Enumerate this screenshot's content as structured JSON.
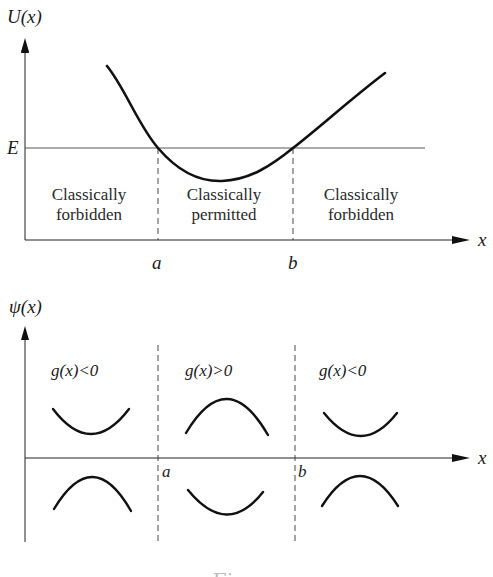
{
  "top_plot": {
    "y_axis_label": "U(x)",
    "x_axis_label": "x",
    "energy_label": "E",
    "turning_points": [
      "a",
      "b"
    ],
    "regions": [
      {
        "line1": "Classically",
        "line2": "forbidden"
      },
      {
        "line1": "Classically",
        "line2": "permitted"
      },
      {
        "line1": "Classically",
        "line2": "forbidden"
      }
    ]
  },
  "bottom_plot": {
    "y_axis_label": "ψ(x)",
    "x_axis_label": "x",
    "turning_points": [
      "a",
      "b"
    ],
    "conditions": [
      "g(x)<0",
      "g(x)>0",
      "g(x)<0"
    ]
  },
  "caption": "Figure"
}
